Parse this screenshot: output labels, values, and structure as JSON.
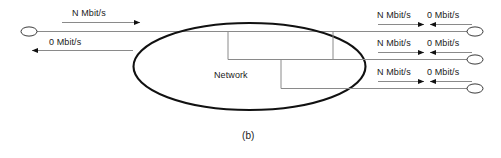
{
  "figure": {
    "caption": "(b)",
    "network_label": "Network",
    "colors": {
      "line": "#8a8a8a",
      "cloud": "#111111",
      "text": "#1a1a1a",
      "arrow": "#111111",
      "background": "#ffffff"
    }
  },
  "left_side": {
    "downstream": {
      "rate": "N Mbit/s",
      "direction": "right"
    },
    "upstream": {
      "rate": "0 Mbit/s",
      "direction": "left"
    },
    "terminal": "node-ellipse"
  },
  "right_side": {
    "rows": [
      {
        "downstream_rate": "N Mbit/s",
        "upstream_rate": "0 Mbit/s",
        "terminal": "node-ellipse"
      },
      {
        "downstream_rate": "N Mbit/s",
        "upstream_rate": "0 Mbit/s",
        "terminal": "node-ellipse"
      },
      {
        "downstream_rate": "N Mbit/s",
        "upstream_rate": "0 Mbit/s",
        "terminal": "node-ellipse"
      }
    ]
  }
}
